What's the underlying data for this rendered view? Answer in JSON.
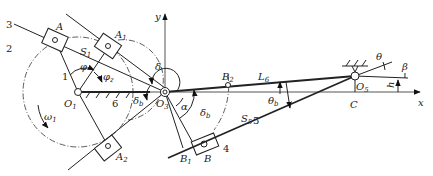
{
  "diagram": {
    "type": "mechanism kinematic diagram",
    "axes": {
      "x": "x",
      "y": "y"
    },
    "points": {
      "O1": "O",
      "O1_sub": "1",
      "O3": "O",
      "O3_sub": "3",
      "O5": "O",
      "O5_sub": "5",
      "A": "A",
      "A1": "A",
      "A1_sub": "1",
      "A2": "A",
      "A2_sub": "2",
      "B": "B",
      "B1": "B",
      "B1_sub": "1",
      "B2": "B",
      "B2_sub": "2",
      "C": "C"
    },
    "links": [
      "1",
      "2",
      "3",
      "4",
      "5",
      "6"
    ],
    "angles": {
      "phi": "φ",
      "phi_z": "φ",
      "phi_z_sub": "z",
      "delta": "δ",
      "delta_b_left": "δ",
      "delta_b_left_sub": "b",
      "delta_b_right": "δ",
      "delta_b_right_sub": "b",
      "alpha": "α",
      "theta": "θ",
      "theta_b": "θ",
      "theta_b_sub": "b",
      "beta": "β"
    },
    "lengths": {
      "S1": "S",
      "S1_sub": "1",
      "S5": "S",
      "S5_sub": "5",
      "L6": "L",
      "L6_sub": "6",
      "h": "h"
    },
    "omega": "ω",
    "omega_sub": "1"
  }
}
